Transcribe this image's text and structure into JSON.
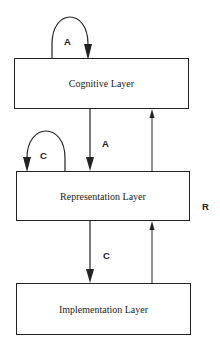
{
  "diagram": {
    "layers": [
      {
        "id": "cognitive",
        "label": "Cognitive Layer"
      },
      {
        "id": "representation",
        "label": "Representation Layer"
      },
      {
        "id": "implementation",
        "label": "Implementation Layer"
      }
    ],
    "edge_labels": {
      "cognitive_self_loop": "A",
      "cognitive_to_representation": "A",
      "representation_self_loop": "C",
      "representation_to_implementation": "C",
      "upward_side": "R"
    },
    "colors": {
      "line": "#222222",
      "background": "#ffffff"
    }
  }
}
